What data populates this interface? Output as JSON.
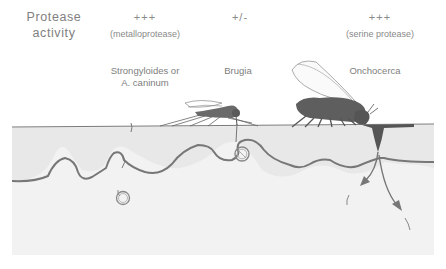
{
  "header": {
    "row_label_line1": "Protease",
    "row_label_line2": "activity"
  },
  "columns": [
    {
      "activity": "+++",
      "protease_type": "(metalloprotease)",
      "organism_line1": "Strongyloides or",
      "organism_line2": "A. caninum",
      "vector": "none (skin penetration)"
    },
    {
      "activity": "+/-",
      "protease_type": "",
      "organism_line1": "Brugia",
      "organism_line2": "",
      "vector": "mosquito"
    },
    {
      "activity": "+++",
      "protease_type": "(serine protease)",
      "organism_line1": "Onchocerca",
      "organism_line2": "",
      "vector": "blackfly"
    }
  ],
  "colors": {
    "skin_fill": "#efefef",
    "line": "#7a7a7a",
    "insect": "#5e5e5e",
    "background": "#ffffff"
  }
}
